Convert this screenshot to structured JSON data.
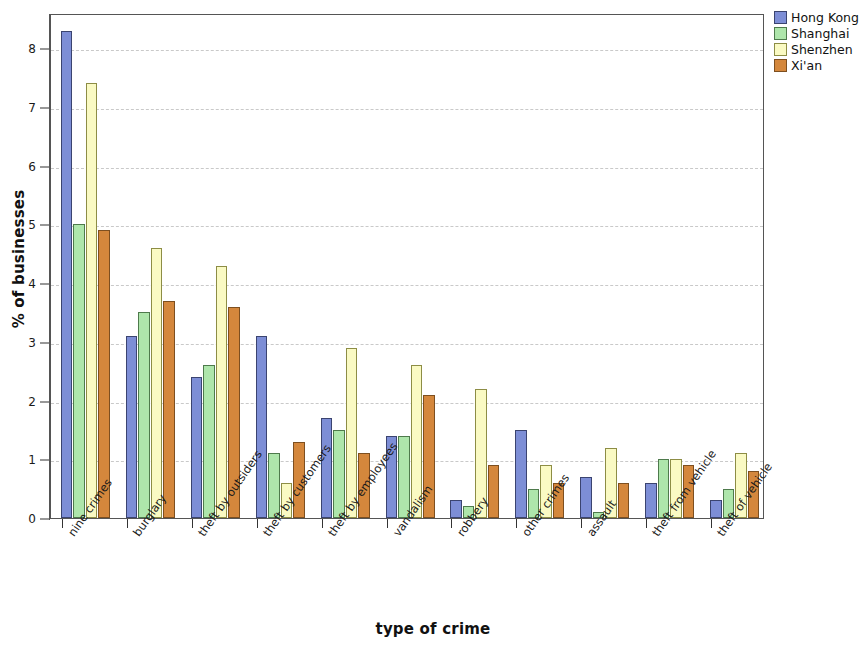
{
  "chart_data": {
    "type": "bar",
    "title": "",
    "xlabel": "type of crime",
    "ylabel": "% of businesses",
    "ylim": [
      0,
      8.6
    ],
    "yticks": [
      0,
      1,
      2,
      3,
      4,
      5,
      6,
      7,
      8
    ],
    "grid": true,
    "legend_position": "top-right",
    "categories": [
      "nine crimes",
      "burglary",
      "theft by outsiders",
      "theft by customers",
      "theft by employees",
      "vandalism",
      "robbery",
      "other crimes",
      "assault",
      "theft from vehicle",
      "theft of vehicle"
    ],
    "series": [
      {
        "name": "Hong Kong",
        "color": "#7d8ed6",
        "values": [
          8.3,
          3.1,
          2.4,
          3.1,
          1.7,
          1.4,
          0.3,
          1.5,
          0.7,
          0.6,
          0.3
        ]
      },
      {
        "name": "Shanghai",
        "color": "#aee6ab",
        "values": [
          5.0,
          3.5,
          2.6,
          1.1,
          1.5,
          1.4,
          0.2,
          0.5,
          0.1,
          1.0,
          0.5
        ]
      },
      {
        "name": "Shenzhen",
        "color": "#fafac3",
        "values": [
          7.4,
          4.6,
          4.3,
          0.6,
          2.9,
          2.6,
          2.2,
          0.9,
          1.2,
          1.0,
          1.1
        ]
      },
      {
        "name": "Xi'an",
        "color": "#d4873c",
        "values": [
          4.9,
          3.7,
          3.6,
          1.3,
          1.1,
          2.1,
          0.9,
          0.6,
          0.6,
          0.9,
          0.8
        ]
      }
    ]
  },
  "legend": {
    "items": [
      {
        "label": "Hong Kong"
      },
      {
        "label": "Shanghai"
      },
      {
        "label": "Shenzhen"
      },
      {
        "label": "Xi'an"
      }
    ]
  },
  "axes": {
    "y_title": "% of businesses",
    "x_title": "type of crime",
    "y_tick_labels": [
      "0",
      "1",
      "2",
      "3",
      "4",
      "5",
      "6",
      "7",
      "8"
    ]
  }
}
